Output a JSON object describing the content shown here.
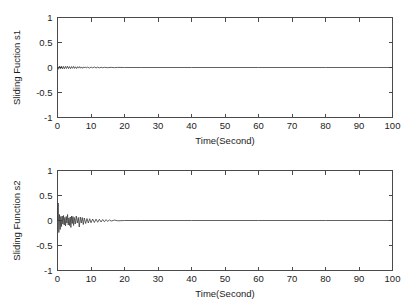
{
  "figure": {
    "background_color": "#ffffff",
    "line_color": "#3a3a3a",
    "axis_color": "#4a4a4a"
  },
  "chart_data": [
    {
      "type": "line",
      "id": "sliding-function-s1",
      "title": "",
      "xlabel": "Time(Second)",
      "ylabel": "Sliding Fuction s1",
      "xlim": [
        0,
        100
      ],
      "ylim": [
        -1,
        1
      ],
      "xticks": [
        0,
        10,
        20,
        30,
        40,
        50,
        60,
        70,
        80,
        90,
        100
      ],
      "yticks": [
        -1,
        -0.5,
        0,
        0.5,
        1
      ],
      "xticklabels": [
        "0",
        "10",
        "20",
        "30",
        "40",
        "50",
        "60",
        "70",
        "80",
        "90",
        "100"
      ],
      "yticklabels": [
        "-1",
        "-0.5",
        "0",
        "0.5",
        "1"
      ],
      "grid": false,
      "legend": null,
      "box": true,
      "tick_direction": "in",
      "series": [
        {
          "name": "s1",
          "x": [
            0,
            0.3,
            0.6,
            0.9,
            1.2,
            1.5,
            1.8,
            2.1,
            2.4,
            2.7,
            3.0,
            3.3,
            3.6,
            3.9,
            4.2,
            4.5,
            4.8,
            5.1,
            5.4,
            5.7,
            6.0,
            6.3,
            6.6,
            6.9,
            7.2,
            7.5,
            7.8,
            8.1,
            8.4,
            8.7,
            9.0,
            9.5,
            10.0,
            10.5,
            11.0,
            11.5,
            12.0,
            12.5,
            13.0,
            13.5,
            14.0,
            15.0,
            16.0,
            17.0,
            18.0,
            20.0,
            25.0,
            30.0,
            40.0,
            50.0,
            60.0,
            70.0,
            80.0,
            90.0,
            100.0
          ],
          "y": [
            0.0,
            -0.035,
            0.03,
            -0.025,
            0.028,
            -0.03,
            0.022,
            -0.026,
            0.024,
            -0.02,
            0.026,
            -0.022,
            0.018,
            -0.024,
            0.02,
            -0.016,
            0.022,
            -0.018,
            0.014,
            -0.02,
            0.016,
            -0.013,
            0.018,
            -0.014,
            0.011,
            -0.016,
            0.012,
            -0.01,
            0.013,
            -0.011,
            0.008,
            -0.012,
            0.009,
            -0.007,
            0.01,
            -0.008,
            0.006,
            -0.008,
            0.005,
            -0.006,
            0.004,
            -0.004,
            0.003,
            -0.003,
            0.002,
            0.0,
            0.0,
            0.0,
            0.0,
            0.0,
            0.0,
            0.0,
            0.0,
            0.0,
            0.0
          ]
        }
      ]
    },
    {
      "type": "line",
      "id": "sliding-function-s2",
      "title": "",
      "xlabel": "Time(Second)",
      "ylabel": "Sliding Function s2",
      "xlim": [
        0,
        100
      ],
      "ylim": [
        -1,
        1
      ],
      "xticks": [
        0,
        10,
        20,
        30,
        40,
        50,
        60,
        70,
        80,
        90,
        100
      ],
      "yticks": [
        -1,
        -0.5,
        0,
        0.5,
        1
      ],
      "xticklabels": [
        "0",
        "10",
        "20",
        "30",
        "40",
        "50",
        "60",
        "70",
        "80",
        "90",
        "100"
      ],
      "yticklabels": [
        "-1",
        "-0.5",
        "0",
        "0.5",
        "1"
      ],
      "grid": false,
      "legend": null,
      "box": true,
      "tick_direction": "in",
      "series": [
        {
          "name": "s2",
          "x": [
            0,
            0.2,
            0.4,
            0.6,
            0.8,
            1.0,
            1.2,
            1.4,
            1.6,
            1.8,
            2.0,
            2.2,
            2.4,
            2.6,
            2.8,
            3.0,
            3.2,
            3.4,
            3.6,
            3.8,
            4.0,
            4.2,
            4.4,
            4.6,
            4.8,
            5.0,
            5.3,
            5.6,
            5.9,
            6.2,
            6.5,
            6.8,
            7.1,
            7.4,
            7.7,
            8.0,
            8.4,
            8.8,
            9.2,
            9.6,
            10.0,
            10.5,
            11.0,
            11.5,
            12.0,
            12.5,
            13.0,
            13.5,
            14.0,
            14.5,
            15.0,
            15.5,
            16.0,
            17.0,
            18.0,
            20.0,
            25.0,
            30.0,
            40.0,
            50.0,
            60.0,
            70.0,
            80.0,
            90.0,
            100.0
          ],
          "y": [
            0.0,
            0.35,
            -0.24,
            0.12,
            -0.18,
            0.08,
            -0.12,
            0.09,
            -0.07,
            0.1,
            -0.09,
            0.06,
            -0.11,
            0.08,
            -0.05,
            0.12,
            -0.09,
            0.05,
            -0.1,
            0.07,
            -0.14,
            0.09,
            -0.06,
            0.08,
            -0.1,
            0.06,
            -0.07,
            0.09,
            -0.05,
            0.06,
            -0.13,
            0.07,
            -0.05,
            0.06,
            -0.08,
            0.05,
            -0.06,
            0.04,
            -0.05,
            0.035,
            -0.045,
            0.03,
            -0.04,
            0.028,
            -0.035,
            0.025,
            -0.03,
            0.02,
            -0.025,
            0.018,
            -0.02,
            0.014,
            -0.012,
            0.008,
            -0.006,
            0.0,
            0.0,
            0.0,
            0.0,
            0.0,
            0.0,
            0.0,
            0.0,
            0.0,
            0.0
          ]
        }
      ]
    }
  ]
}
